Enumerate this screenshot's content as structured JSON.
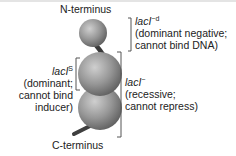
{
  "figure": {
    "n_terminus_label": "N-terminus",
    "c_terminus_label": "C-terminus",
    "annotations": [
      {
        "gene": "lacI",
        "superscript": "−d",
        "line1": "(dominant negative;",
        "line2": "cannot bind DNA)"
      },
      {
        "gene": "lacI",
        "superscript": "S",
        "line1": "(dominant;",
        "line2": "cannot bind",
        "line3": "inducer)"
      },
      {
        "gene": "lacI",
        "superscript": "−",
        "line1": "(recessive;",
        "line2": "cannot repress)"
      }
    ],
    "colors": {
      "sphere": "#8a8a8a",
      "sphere_highlight": "#c8c8c8",
      "linker": "#444444",
      "bracket": "#555555",
      "text": "#222222"
    }
  }
}
